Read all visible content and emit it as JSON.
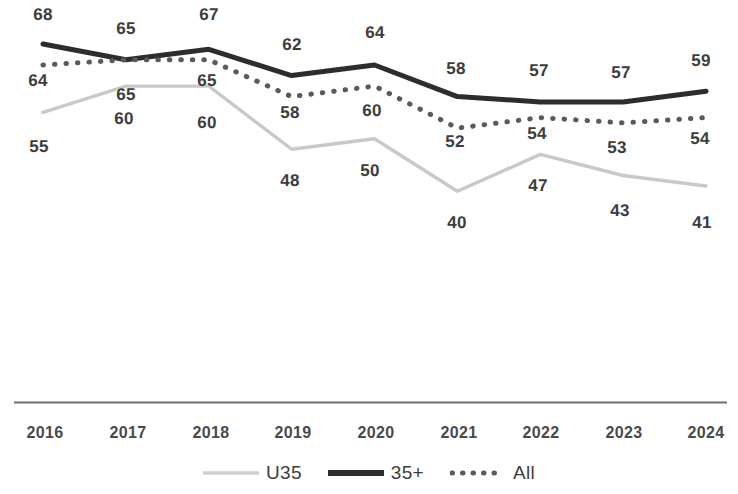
{
  "chart_data": {
    "type": "line",
    "title": "",
    "subtitle": "",
    "xlabel": "",
    "ylabel": "",
    "grid": false,
    "legend_position": "bottom",
    "ylim": [
      30,
      72
    ],
    "categories": [
      "2016",
      "2017",
      "2018",
      "2019",
      "2020",
      "2021",
      "2022",
      "2023",
      "2024"
    ],
    "series": [
      {
        "name": "U35",
        "style": "solid",
        "color": "#c9c9c9",
        "values": [
          55,
          60,
          60,
          48,
          50,
          40,
          47,
          43,
          41
        ]
      },
      {
        "name": "35+",
        "style": "solid",
        "color": "#2d2d2d",
        "values": [
          68,
          65,
          67,
          62,
          64,
          58,
          57,
          57,
          59
        ]
      },
      {
        "name": "All",
        "style": "dotted",
        "color": "#5a5a5a",
        "values": [
          64,
          65,
          65,
          58,
          60,
          52,
          54,
          53,
          54
        ]
      }
    ]
  },
  "axis": {
    "ticks": [
      "2016",
      "2017",
      "2018",
      "2019",
      "2020",
      "2021",
      "2022",
      "2023",
      "2024"
    ],
    "line_color": "#6e6e6e"
  },
  "legend": {
    "items": [
      {
        "label": "U35",
        "swatch": "line-light-solid-swatch"
      },
      {
        "label": "35+",
        "swatch": "line-dark-solid-swatch"
      },
      {
        "label": "All",
        "swatch": "line-dotted-swatch"
      }
    ]
  },
  "labels": {
    "older": [
      "68",
      "65",
      "67",
      "62",
      "64",
      "58",
      "57",
      "57",
      "59"
    ],
    "all": [
      "64",
      "65",
      "65",
      "58",
      "60",
      "52",
      "54",
      "53",
      "54"
    ],
    "under35": [
      "55",
      "60",
      "60",
      "48",
      "50",
      "40",
      "47",
      "43",
      "41"
    ]
  }
}
